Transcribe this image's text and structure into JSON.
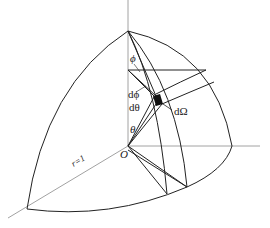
{
  "diagram": {
    "type": "solid-angle-element-on-unit-sphere-octant",
    "labels": {
      "phi": "ϕ",
      "dphi": "dϕ",
      "dtheta": "dθ",
      "theta": "θ",
      "dOmega": "dΩ",
      "origin": "O",
      "radius": "r=1"
    },
    "colors": {
      "stroke": "#222222",
      "axis": "#888888",
      "patch": "#111111",
      "background": "#ffffff"
    }
  }
}
